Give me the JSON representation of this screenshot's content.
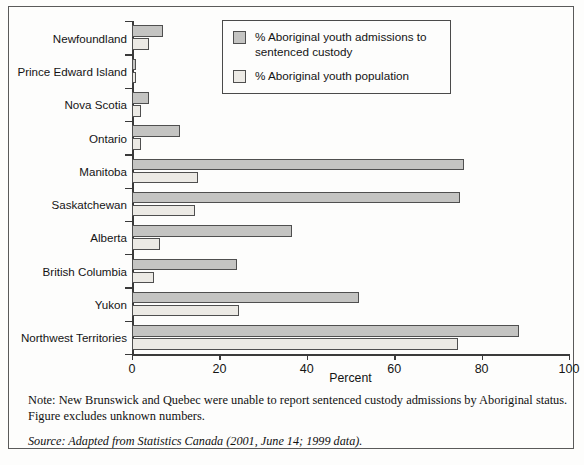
{
  "chart_data": {
    "type": "bar",
    "orientation": "horizontal",
    "title": "",
    "xlabel": "Percent",
    "ylabel": "",
    "xlim": [
      0,
      100
    ],
    "xticks": [
      0,
      20,
      40,
      60,
      80,
      100
    ],
    "grid": false,
    "legend_position": "top-right-inside",
    "categories": [
      "Newfoundland",
      "Prince Edward Island",
      "Nova Scotia",
      "Ontario",
      "Manitoba",
      "Saskatchewan",
      "Alberta",
      "British Columbia",
      "Yukon",
      "Northwest Territories"
    ],
    "series": [
      {
        "name": "% Aboriginal youth admissions to sentenced custody",
        "color": "#c4c4c2",
        "values": [
          7,
          1,
          4,
          11,
          76,
          75,
          36.5,
          24,
          52,
          88.5
        ]
      },
      {
        "name": "% Aboriginal youth population",
        "color": "#eceae5",
        "values": [
          4,
          1,
          2,
          2,
          15,
          14.5,
          6.5,
          5,
          24.5,
          74.5
        ]
      }
    ]
  },
  "legend": {
    "entries": [
      {
        "label": "% Aboriginal youth admissions to sentenced custody",
        "swatch": "admissions"
      },
      {
        "label": "% Aboriginal youth population",
        "swatch": "population"
      }
    ]
  },
  "axis": {
    "x_title": "Percent",
    "tick_labels": [
      "0",
      "20",
      "40",
      "60",
      "80",
      "100"
    ]
  },
  "footer": {
    "note": "Note: New Brunswick and Quebec were unable to report sentenced custody admissions by Aboriginal status. Figure excludes unknown numbers.",
    "source": "Source: Adapted from Statistics Canada (2001, June 14; 1999 data)."
  }
}
